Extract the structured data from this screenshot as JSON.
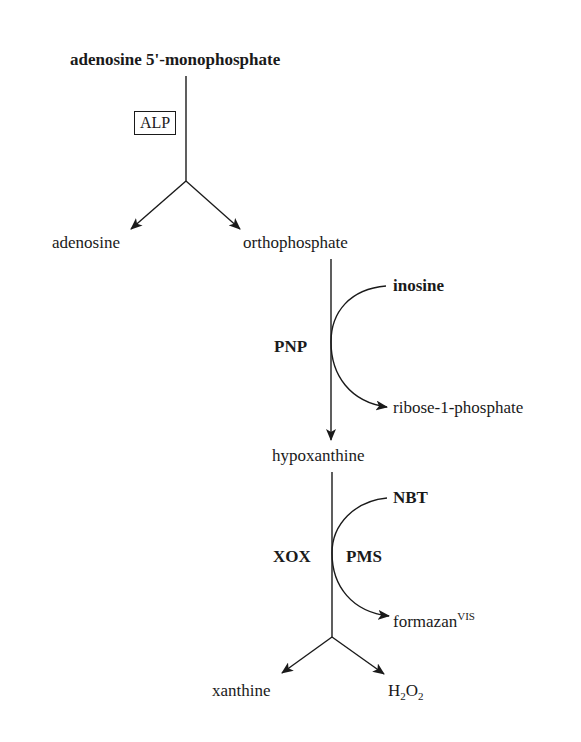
{
  "diagram": {
    "type": "biochemical reaction pathway",
    "nodes": {
      "amp": "adenosine 5'-monophosphate",
      "adenosine": "adenosine",
      "orthophosphate": "orthophosphate",
      "inosine": "inosine",
      "ribose1p": "ribose-1-phosphate",
      "hypoxanthine": "hypoxanthine",
      "nbt": "NBT",
      "formazan": "formazan",
      "formazan_sup": "VIS",
      "xanthine": "xanthine",
      "h2o2_h": "H",
      "h2o2_sub1": "2",
      "h2o2_o": "O",
      "h2o2_sub2": "2"
    },
    "enzymes": {
      "alp": "ALP",
      "pnp": "PNP",
      "xox": "XOX",
      "pms": "PMS"
    },
    "edges": [
      {
        "from": "adenosine 5'-monophosphate",
        "to": [
          "adenosine",
          "orthophosphate"
        ],
        "enzyme": "ALP"
      },
      {
        "from": "orthophosphate",
        "to": "hypoxanthine",
        "enzyme": "PNP",
        "cosubstrate": "inosine",
        "coproduct": "ribose-1-phosphate"
      },
      {
        "from": "hypoxanthine",
        "to": [
          "xanthine",
          "H2O2"
        ],
        "enzyme": "XOX",
        "mediator": "PMS",
        "cosubstrate": "NBT",
        "coproduct": "formazan (VIS)"
      }
    ]
  }
}
